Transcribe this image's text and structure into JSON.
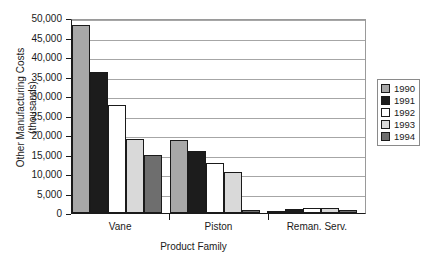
{
  "chart_data": {
    "type": "bar",
    "title": "",
    "xlabel": "Product Family",
    "ylabel": "Other Manufacturing Costs (thousands)",
    "ylabel_line1": "Other Manufacturing Costs",
    "ylabel_line2": "(thousands)",
    "categories": [
      "Vane",
      "Piston",
      "Reman. Serv."
    ],
    "ylim": [
      0,
      50000
    ],
    "ytick_step": 5000,
    "ytick_labels": [
      "50,000",
      "45,000",
      "40,000",
      "35,000",
      "30,000",
      "25,000",
      "20,000",
      "15,000",
      "10,000",
      "5,000",
      "0"
    ],
    "ytick_values": [
      50000,
      45000,
      40000,
      35000,
      30000,
      25000,
      20000,
      15000,
      10000,
      5000,
      0
    ],
    "grid": "horizontal",
    "legend_position": "right",
    "series": [
      {
        "name": "1990",
        "color": "#a8a8a8",
        "values": [
          48200,
          18700,
          600
        ]
      },
      {
        "name": "1991",
        "color": "#1c1c1c",
        "values": [
          36200,
          16000,
          1100
        ]
      },
      {
        "name": "1992",
        "color": "#ffffff",
        "values": [
          27600,
          12900,
          1200
        ]
      },
      {
        "name": "1993",
        "color": "#d9d9d9",
        "values": [
          19100,
          10400,
          1200
        ]
      },
      {
        "name": "1994",
        "color": "#6e6e6e",
        "values": [
          15000,
          800,
          700
        ]
      }
    ]
  },
  "legend": {
    "items": [
      {
        "label": "1990",
        "color": "#a8a8a8"
      },
      {
        "label": "1991",
        "color": "#1c1c1c"
      },
      {
        "label": "1992",
        "color": "#ffffff"
      },
      {
        "label": "1993",
        "color": "#d9d9d9"
      },
      {
        "label": "1994",
        "color": "#6e6e6e"
      }
    ]
  }
}
